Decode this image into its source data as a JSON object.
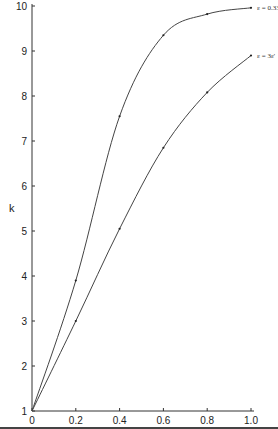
{
  "chart_data": {
    "type": "line",
    "title": "",
    "xlabel": "",
    "ylabel": "k",
    "xlim": [
      0,
      1.0
    ],
    "ylim": [
      1,
      10
    ],
    "x_ticks": [
      "0",
      "0.2",
      "0.4",
      "0.6",
      "0.8",
      "1.0"
    ],
    "y_ticks": [
      "1",
      "2",
      "3",
      "4",
      "5",
      "6",
      "7",
      "8",
      "9",
      "10"
    ],
    "grid": false,
    "legend": "inline-right",
    "series": [
      {
        "name": "ε = 0.33",
        "x": [
          0,
          0.2,
          0.4,
          0.6,
          0.8,
          1.0
        ],
        "values": [
          1.0,
          3.9,
          7.55,
          9.35,
          9.82,
          9.96
        ]
      },
      {
        "name": "ε = 3ε'",
        "x": [
          0,
          0.2,
          0.4,
          0.6,
          0.8,
          1.0
        ],
        "values": [
          1.0,
          3.0,
          5.05,
          6.85,
          8.08,
          8.9
        ]
      }
    ]
  }
}
